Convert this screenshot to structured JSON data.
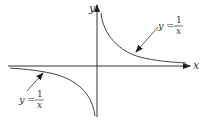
{
  "diagram": {
    "axes": {
      "x_label": "x",
      "y_label": "y"
    },
    "annotations": [
      {
        "lhs": "y",
        "eq": "=",
        "num": "1",
        "den": "x",
        "branch": "first-quadrant"
      },
      {
        "lhs": "y",
        "eq": "=",
        "num": "1",
        "den": "x",
        "branch": "third-quadrant"
      }
    ],
    "colors": {
      "stroke": "#333333",
      "background": "#ffffff"
    }
  }
}
